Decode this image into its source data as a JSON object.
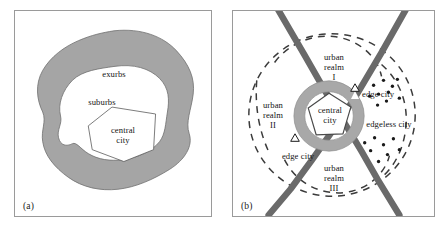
{
  "figure": {
    "background_color": "#ffffff",
    "panel_border_color": "#9a9a9a"
  },
  "colors": {
    "shade_gray": "#a5a5a5",
    "ring_gray": "#a8a8a8",
    "highway_gray": "#6a6a6a",
    "outline_dark": "#4a4a4a",
    "dash_gray": "#3b3b3b",
    "text": "#141414",
    "white": "#ffffff"
  },
  "panel_a": {
    "caption": "(a)",
    "model_name": "concentric-zone model",
    "zones": [
      {
        "id": "exurbs",
        "label": "exurbs",
        "fill": "#a5a5a5",
        "order": 3
      },
      {
        "id": "suburbs",
        "label": "suburbs",
        "fill": "#ffffff",
        "order": 2
      },
      {
        "id": "central-city",
        "label": "central\ncity",
        "label_line1": "central",
        "label_line2": "city",
        "fill": "#ffffff",
        "order": 1
      }
    ]
  },
  "panel_b": {
    "caption": "(b)",
    "model_name": "polycentric urban-realms model",
    "center": {
      "label_line1": "central",
      "label_line2": "city",
      "shape": "gray-ring-with-white-pentagon"
    },
    "realms": [
      {
        "label_line1": "urban",
        "label_line2": "realm",
        "numeral": "I",
        "position": "north"
      },
      {
        "label_line1": "urban",
        "label_line2": "realm",
        "numeral": "II",
        "position": "west"
      },
      {
        "label_line1": "urban",
        "label_line2": "realm",
        "numeral": "III",
        "position": "south"
      }
    ],
    "edge_cities": [
      {
        "label": "edge city",
        "marker": "triangle",
        "position": "northeast"
      },
      {
        "label": "edge city",
        "marker": "triangle",
        "position": "southwest"
      }
    ],
    "edgeless_city": {
      "label": "edgeless city",
      "marker": "scattered-dots",
      "position": "east"
    },
    "highways": {
      "count": 2,
      "style": "thick-crossing-corridors",
      "color": "#6a6a6a"
    },
    "realm_boundaries": {
      "style": "dashed",
      "color": "#3b3b3b"
    }
  }
}
